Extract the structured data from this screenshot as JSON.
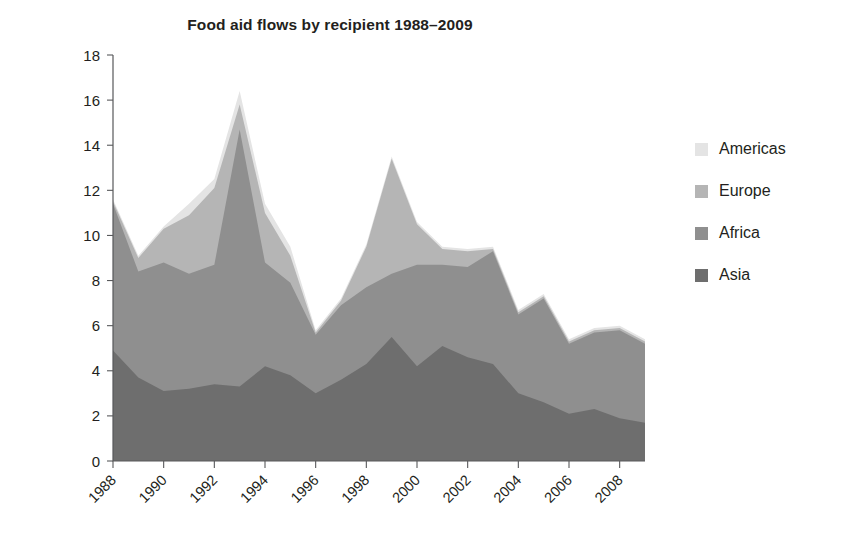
{
  "chart_data": {
    "type": "area",
    "stacked": true,
    "title": "Food aid flows by recipient 1988–2009",
    "xlabel": "",
    "ylabel": "Million tonnes",
    "ylim": [
      0,
      18
    ],
    "ytick_step": 2,
    "ytick_labels": [
      "0",
      "2",
      "4",
      "6",
      "8",
      "10",
      "12",
      "14",
      "16",
      "18"
    ],
    "xlim": [
      1988,
      2009
    ],
    "x": [
      1988,
      1989,
      1990,
      1991,
      1992,
      1993,
      1994,
      1995,
      1996,
      1997,
      1998,
      1999,
      2000,
      2001,
      2002,
      2003,
      2004,
      2005,
      2006,
      2007,
      2008,
      2009
    ],
    "xtick_labels": [
      "1988",
      "1990",
      "1992",
      "1994",
      "1996",
      "1998",
      "2000",
      "2002",
      "2004",
      "2006",
      "2008"
    ],
    "xtick_values": [
      1988,
      1990,
      1992,
      1994,
      1996,
      1998,
      2000,
      2002,
      2004,
      2006,
      2008
    ],
    "grid": false,
    "legend_position": "right",
    "series": [
      {
        "name": "Asia",
        "color": "#6e6e6e",
        "order": 1,
        "values": [
          4.9,
          3.7,
          3.1,
          3.2,
          3.4,
          3.3,
          4.2,
          3.8,
          3.0,
          3.6,
          4.3,
          5.5,
          4.2,
          5.1,
          4.6,
          4.3,
          3.0,
          2.6,
          2.1,
          2.3,
          1.9,
          1.7
        ]
      },
      {
        "name": "Africa",
        "color": "#8f8f8f",
        "order": 2,
        "values": [
          6.5,
          4.7,
          5.7,
          5.1,
          5.3,
          11.4,
          4.6,
          4.1,
          2.6,
          3.3,
          3.4,
          2.8,
          4.5,
          3.6,
          4.0,
          5.0,
          3.5,
          4.6,
          3.1,
          3.4,
          3.9,
          3.5
        ]
      },
      {
        "name": "Europe",
        "color": "#b5b5b5",
        "order": 3,
        "values": [
          0.1,
          0.6,
          1.5,
          2.6,
          3.4,
          1.1,
          2.2,
          1.2,
          0.1,
          0.2,
          1.8,
          5.1,
          1.8,
          0.7,
          0.7,
          0.1,
          0.1,
          0.1,
          0.1,
          0.1,
          0.1,
          0.1
        ]
      },
      {
        "name": "Americas",
        "color": "#e4e4e4",
        "order": 4,
        "values": [
          0.1,
          0.1,
          0.1,
          0.5,
          0.4,
          0.6,
          0.4,
          0.4,
          0.1,
          0.1,
          0.1,
          0.1,
          0.1,
          0.1,
          0.1,
          0.1,
          0.1,
          0.1,
          0.1,
          0.1,
          0.1,
          0.1
        ]
      }
    ]
  },
  "legend": {
    "items": [
      {
        "label": "Americas",
        "color": "#e4e4e4"
      },
      {
        "label": "Europe",
        "color": "#b5b5b5"
      },
      {
        "label": "Africa",
        "color": "#8f8f8f"
      },
      {
        "label": "Asia",
        "color": "#6e6e6e"
      }
    ]
  }
}
